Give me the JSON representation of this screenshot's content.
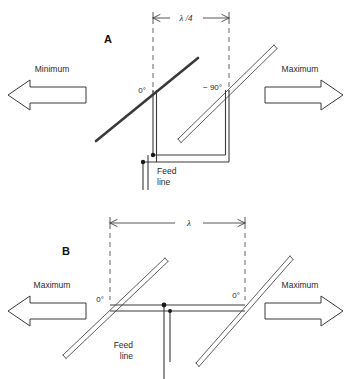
{
  "figure": {
    "background_color": "#ffffff",
    "line_color": "#3a3a3a"
  },
  "panels": [
    {
      "id": "A",
      "label": "A",
      "dimension": {
        "label": "λ /4",
        "meaning": "quarter wavelength element spacing"
      },
      "elements": [
        {
          "name": "left-dipole",
          "phase_label": "0°"
        },
        {
          "name": "right-dipole",
          "phase_label": "− 90°"
        }
      ],
      "radiation": {
        "left": {
          "label": "Minimum",
          "direction": "left"
        },
        "right": {
          "label": "Maximum",
          "direction": "right"
        }
      },
      "feed": {
        "line1": "Feed",
        "line2": "line"
      }
    },
    {
      "id": "B",
      "label": "B",
      "dimension": {
        "label": "λ",
        "meaning": "one wavelength element spacing"
      },
      "elements": [
        {
          "name": "left-dipole",
          "phase_label": "0°"
        },
        {
          "name": "right-dipole",
          "phase_label": "0°"
        }
      ],
      "radiation": {
        "left": {
          "label": "Maximum",
          "direction": "left"
        },
        "right": {
          "label": "Maximum",
          "direction": "right"
        }
      },
      "feed": {
        "line1": "Feed",
        "line2": "line"
      }
    }
  ]
}
